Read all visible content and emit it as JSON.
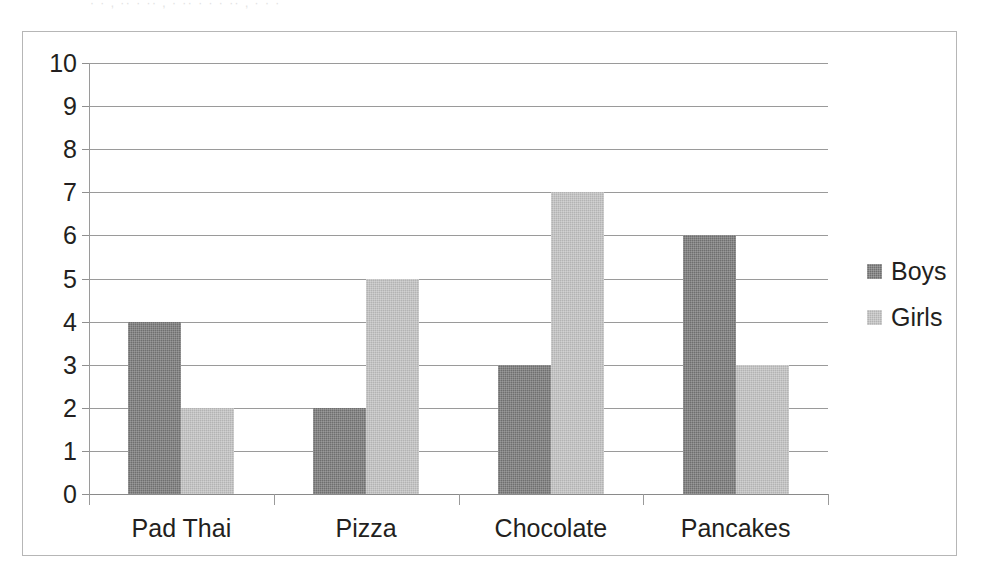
{
  "scan": {
    "top_fragment": "· · , ·· · ·· , · ·· · · · ·· , · · ·"
  },
  "chart_data": {
    "type": "bar",
    "title": "",
    "subtitle": "",
    "xlabel": "",
    "ylabel": "",
    "categories": [
      "Pad Thai",
      "Pizza",
      "Chocolate",
      "Pancakes"
    ],
    "series": [
      {
        "name": "Boys",
        "values": [
          4,
          2,
          3,
          6
        ],
        "color": "#6f6f6f"
      },
      {
        "name": "Girls",
        "values": [
          2,
          5,
          7,
          3
        ],
        "color": "#b3b3b3"
      }
    ],
    "ylim": [
      0,
      10
    ],
    "ytick_step": 1,
    "ytick_labels": [
      "10",
      "9",
      "8",
      "7",
      "6",
      "5",
      "4",
      "3",
      "2",
      "1",
      "0"
    ],
    "grid": true,
    "grid_axis": "y",
    "legend_position": "right",
    "legend": [
      "Boys",
      "Girls"
    ],
    "annotations": []
  },
  "legend": {
    "items": [
      {
        "label": "Boys",
        "swatch": "boys-swatch"
      },
      {
        "label": "Girls",
        "swatch": "girls-swatch"
      }
    ]
  },
  "colors": {
    "boys": "#6f6f6f",
    "girls": "#b3b3b3",
    "grid": "#9a9a9a",
    "frame": "#b6b6b6",
    "text": "#231f20",
    "background": "#ffffff"
  }
}
